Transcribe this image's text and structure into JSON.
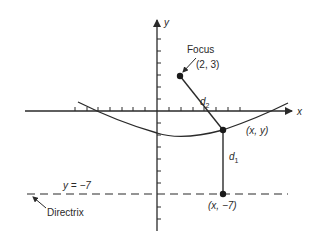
{
  "diagram": {
    "colors": {
      "ink": "#2a2a2a",
      "background": "#ffffff"
    },
    "axes": {
      "x_label": "x",
      "y_label": "y",
      "origin_px": [
        157,
        111
      ],
      "unit_px": 11.7
    },
    "focus": {
      "label": "Focus",
      "coords_label": "(2, 3)",
      "x": 2,
      "y": 3
    },
    "point": {
      "label": "(x, y)"
    },
    "directrix_point": {
      "label": "(x, −7)"
    },
    "directrix": {
      "equation": "y = −7",
      "label": "Directrix",
      "y": -7
    },
    "distances": {
      "d1_base": "d",
      "d1_sub": "1",
      "d2_base": "d",
      "d2_sub": "2"
    }
  }
}
